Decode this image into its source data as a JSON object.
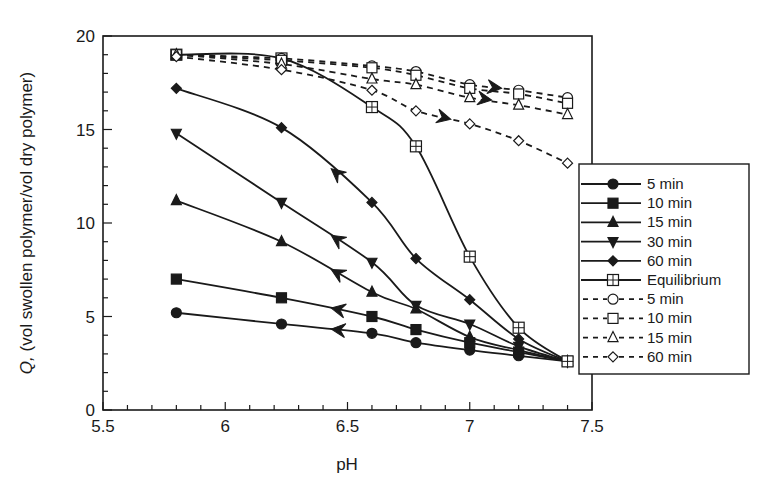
{
  "chart_data": {
    "type": "line",
    "title": "",
    "xlabel": "pH",
    "ylabel_italic": "Q,",
    "ylabel": " (vol swollen polymer/vol dry polymer)",
    "xlim": [
      5.5,
      7.5
    ],
    "ylim": [
      0,
      20
    ],
    "xticks": [
      "5.5",
      "6",
      "6.5",
      "7",
      "7.5"
    ],
    "yticks": [
      "0",
      "5",
      "10",
      "15",
      "20"
    ],
    "grid": false,
    "legend_position": "right, overlapping plot edge",
    "x": [
      5.8,
      6.23,
      6.6,
      6.78,
      7.0,
      7.2,
      7.4
    ],
    "series": [
      {
        "name": "5 min",
        "style": "solid",
        "marker": "circle-filled",
        "values": [
          5.2,
          4.6,
          4.1,
          3.6,
          3.2,
          2.9,
          2.6
        ]
      },
      {
        "name": "10 min",
        "style": "solid",
        "marker": "square-filled",
        "values": [
          7.0,
          6.0,
          5.0,
          4.3,
          3.6,
          3.1,
          2.6
        ]
      },
      {
        "name": "15 min",
        "style": "solid",
        "marker": "triangle-up-filled",
        "values": [
          11.2,
          9.0,
          6.3,
          5.4,
          3.9,
          3.2,
          2.6
        ]
      },
      {
        "name": "30 min",
        "style": "solid",
        "marker": "triangle-down-filled",
        "values": [
          14.8,
          11.1,
          7.9,
          5.6,
          4.6,
          3.4,
          2.6
        ]
      },
      {
        "name": "60 min",
        "style": "solid",
        "marker": "diamond-filled",
        "values": [
          17.2,
          15.1,
          11.1,
          8.1,
          5.9,
          3.8,
          2.6
        ]
      },
      {
        "name": "Equilibrium",
        "style": "solid",
        "marker": "square-cross-open",
        "values": [
          19.0,
          18.8,
          16.2,
          14.1,
          8.2,
          4.4,
          2.6
        ]
      },
      {
        "name": "5 min",
        "style": "dashed",
        "marker": "circle-open",
        "values": [
          19.0,
          18.8,
          18.4,
          18.1,
          17.4,
          17.1,
          16.7
        ]
      },
      {
        "name": "10 min",
        "style": "dashed",
        "marker": "square-open",
        "values": [
          19.0,
          18.7,
          18.3,
          17.9,
          17.2,
          16.9,
          16.4
        ]
      },
      {
        "name": "15 min",
        "style": "dashed",
        "marker": "triangle-up-open",
        "values": [
          19.0,
          18.5,
          17.7,
          17.4,
          16.7,
          16.3,
          15.8
        ]
      },
      {
        "name": "60 min",
        "style": "dashed",
        "marker": "diamond-open",
        "values": [
          18.9,
          18.2,
          17.1,
          16.0,
          15.3,
          14.4,
          13.2
        ]
      }
    ],
    "annotations": [
      {
        "type": "arrow",
        "direction": "left (decreasing pH)",
        "on": "solid curves",
        "note": "arrowheads pointing toward lower pH"
      },
      {
        "type": "arrow",
        "direction": "right (increasing pH)",
        "on": "dashed curves",
        "note": "arrowheads pointing toward higher pH"
      }
    ]
  },
  "colors": {
    "ink": "#1a1a1a",
    "background": "#ffffff"
  }
}
